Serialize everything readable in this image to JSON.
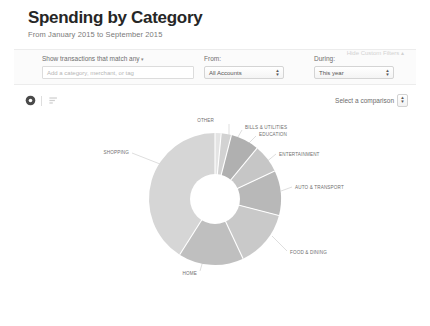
{
  "header": {
    "title": "Spending by Category",
    "subtitle": "From January 2015 to September 2015"
  },
  "filters": {
    "match_label": "Show transactions that match any",
    "match_caret": "▾",
    "match_input_placeholder": "Add a category, merchant, or tag",
    "match_input_value": "",
    "from_label": "From:",
    "from_value": "All Accounts",
    "during_label": "During:",
    "during_value": "This year",
    "custom_filters_toggle": "Hide Custom Filters ▴"
  },
  "view_controls": {
    "pie_view_name": "pie-chart-view",
    "list_view_name": "bar-list-view",
    "comparison_label": "Select a comparison"
  },
  "colors": {
    "slice_light": "#dcdcdc",
    "slice_medium": "#c9c9c9",
    "slice_dark": "#b4b4b4",
    "separator": "#ffffff",
    "label_text": "#6f6f6f",
    "leader_line": "#b9b9b9"
  },
  "chart_data": {
    "type": "pie",
    "title": "Spending by Category",
    "donut": true,
    "inner_radius_ratio": 0.38,
    "legend_position": "callout-labels",
    "categories": [
      "OTHER",
      "BILLS & UTILITIES",
      "EDUCATION",
      "ENTERTAINMENT",
      "AUTO & TRANSPORT",
      "FOOD & DINING",
      "HOME",
      "SHOPPING"
    ],
    "values": [
      1.5,
      2.5,
      7,
      7,
      11,
      14,
      16,
      41
    ],
    "unit": "percent",
    "slices": [
      {
        "label": "OTHER",
        "value": 1.5,
        "color": "#e4e4e4"
      },
      {
        "label": "BILLS & UTILITIES",
        "value": 2.5,
        "color": "#d2d2d2"
      },
      {
        "label": "EDUCATION",
        "value": 7,
        "color": "#b0b0b0"
      },
      {
        "label": "ENTERTAINMENT",
        "value": 7,
        "color": "#c6c6c6"
      },
      {
        "label": "AUTO & TRANSPORT",
        "value": 11,
        "color": "#b8b8b8"
      },
      {
        "label": "FOOD & DINING",
        "value": 14,
        "color": "#c9c9c9"
      },
      {
        "label": "HOME",
        "value": 16,
        "color": "#bfbfbf"
      },
      {
        "label": "SHOPPING",
        "value": 41,
        "color": "#d6d6d6"
      }
    ]
  }
}
